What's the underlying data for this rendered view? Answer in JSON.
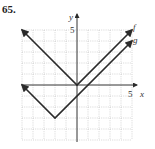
{
  "problem": {
    "number": "65."
  },
  "chart_data": {
    "type": "line",
    "title": "",
    "xlabel": "x",
    "ylabel": "y",
    "xlim": [
      -5,
      5
    ],
    "ylim": [
      -5,
      5
    ],
    "grid": true,
    "tick_labels": {
      "x": "5",
      "y": "5"
    },
    "series": [
      {
        "name": "f",
        "label": "f",
        "expression": "f(x) = |x|",
        "points": [
          [
            -5,
            5
          ],
          [
            0,
            0
          ],
          [
            5,
            5
          ]
        ],
        "vertex": [
          0,
          0
        ]
      },
      {
        "name": "g",
        "label": "g",
        "expression": "g(x) = |x+2| - 3",
        "points": [
          [
            -5,
            0
          ],
          [
            -2,
            -3
          ],
          [
            5,
            4
          ]
        ],
        "vertex": [
          -2,
          -3
        ]
      }
    ],
    "colors": {
      "line": "#2a2a2a",
      "grid": "#b8b8b8",
      "axis": "#333333"
    }
  }
}
